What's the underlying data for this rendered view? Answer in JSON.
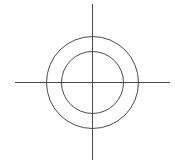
{
  "diagram": {
    "type": "concentric-circles-with-crosshair",
    "canvas": {
      "width": 175,
      "height": 165,
      "background": "#ffffff"
    },
    "stroke_color": "#4a4a4a",
    "stroke_width": 1,
    "center": {
      "x": 92,
      "y": 82
    },
    "circles": [
      {
        "name": "outer",
        "r": 46
      },
      {
        "name": "inner",
        "r": 31
      }
    ],
    "horizontal_axis": {
      "x1": 15,
      "x2": 170,
      "y": 82
    },
    "vertical_axis": {
      "x": 92,
      "y1": 4,
      "y2": 160
    }
  }
}
